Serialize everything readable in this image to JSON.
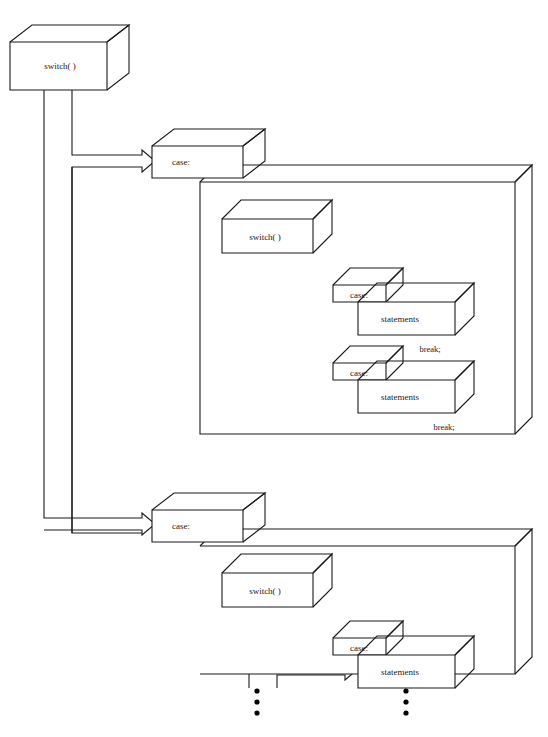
{
  "diagram": {
    "type": "3d-block-flowchart",
    "stroke_color": "#1a1a1a",
    "fill_color": "#ffffff",
    "background": "#ffffff"
  },
  "labels": {
    "outer_switch": "switch( )",
    "case_1": "case:",
    "case_2": "case:",
    "inner1_switch": "switch( )",
    "inner1_case_a": "case:",
    "inner1_statements_a": "statements",
    "inner1_break_a": "break;",
    "inner1_case_b": "case:",
    "inner1_statements_b": "statements",
    "inner1_break_b": "break;",
    "inner2_switch": "switch( )",
    "inner2_case_a": "case:",
    "inner2_statements_a": "statements",
    "ellipsis_left": "⋮",
    "ellipsis_right": "⋮"
  },
  "nodes": [
    {
      "name": "outer-switch-box",
      "label": "switch( )",
      "x": 10,
      "y": 42,
      "w": 97,
      "h": 48,
      "depth": 22
    },
    {
      "name": "case-1-box",
      "label": "case:",
      "x": 152,
      "y": 146,
      "w": 91,
      "h": 32,
      "depth": 22
    },
    {
      "name": "case-1-body-container",
      "label": "",
      "x": 200,
      "y": 182,
      "w": 315,
      "h": 252,
      "depth": 17
    },
    {
      "name": "inner-switch-1-box",
      "label": "switch( )",
      "x": 222,
      "y": 219,
      "w": 91,
      "h": 34,
      "depth": 19
    },
    {
      "name": "inner1-case-a-box",
      "label": "case:",
      "x": 333,
      "y": 285,
      "w": 53,
      "h": 17,
      "depth": 17
    },
    {
      "name": "inner1-statements-a-box",
      "label": "statements",
      "x": 358,
      "y": 302,
      "w": 97,
      "h": 33,
      "depth": 19
    },
    {
      "name": "inner1-case-b-box",
      "label": "case:",
      "x": 333,
      "y": 363,
      "w": 53,
      "h": 17,
      "depth": 17
    },
    {
      "name": "inner1-statements-b-box",
      "label": "statements",
      "x": 358,
      "y": 380,
      "w": 97,
      "h": 33,
      "depth": 19
    },
    {
      "name": "case-2-box",
      "label": "case:",
      "x": 152,
      "y": 510,
      "w": 91,
      "h": 32,
      "depth": 22
    },
    {
      "name": "case-2-body-container",
      "label": "",
      "x": 200,
      "y": 546,
      "w": 315,
      "h": 128,
      "depth": 17
    },
    {
      "name": "inner-switch-2-box",
      "label": "switch( )",
      "x": 222,
      "y": 573,
      "w": 91,
      "h": 34,
      "depth": 19
    },
    {
      "name": "inner2-case-a-box",
      "label": "case:",
      "x": 333,
      "y": 638,
      "w": 53,
      "h": 17,
      "depth": 17
    },
    {
      "name": "inner2-statements-a-box",
      "label": "statements",
      "x": 358,
      "y": 655,
      "w": 97,
      "h": 33,
      "depth": 19
    }
  ],
  "annotations": [
    {
      "name": "break-annotation-1",
      "text": "break;",
      "x": 430,
      "y": 352
    },
    {
      "name": "break-annotation-2",
      "text": "break;",
      "x": 444,
      "y": 430
    }
  ],
  "ellipses": [
    {
      "name": "ellipsis-left-switch",
      "x": 257,
      "y": 700
    },
    {
      "name": "ellipsis-right-statements",
      "x": 406,
      "y": 700
    }
  ]
}
